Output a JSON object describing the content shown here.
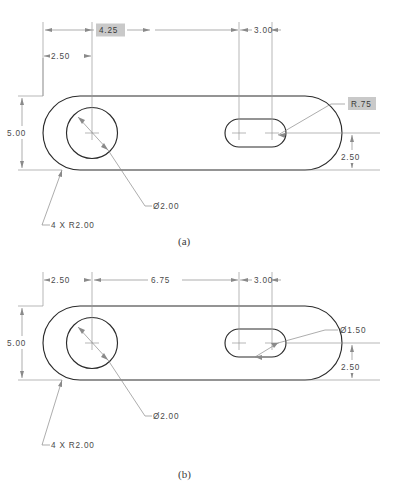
{
  "page": {
    "background_color": "#ffffff",
    "line_color": "#2b2b2b",
    "dimension_color": "#8a8a8a",
    "highlight_color": "#c9c9c9"
  },
  "figures": [
    {
      "id": "a",
      "caption": "(a)",
      "dimensions": {
        "overall_width_to_slot_start": "4.25",
        "overall_width_highlighted": true,
        "hole_offset_from_left": "2.50",
        "slot_length": "3.00",
        "part_height": "5.00",
        "slot_center_from_bottom": "2.50",
        "hole_diameter": "Ø2.00",
        "corner_radii": "4 X R2.00",
        "slot_end_radius": "R.75",
        "slot_end_radius_highlighted": true
      },
      "labels": [
        {
          "name": "dim-4-25",
          "text": "4.25",
          "highlighted": true
        },
        {
          "name": "dim-2-50-top",
          "text": "2.50",
          "highlighted": false
        },
        {
          "name": "dim-3-00",
          "text": "3.00",
          "highlighted": false
        },
        {
          "name": "dim-5-00",
          "text": "5.00",
          "highlighted": false
        },
        {
          "name": "dim-2-50-right",
          "text": "2.50",
          "highlighted": false
        },
        {
          "name": "dim-hole-dia",
          "text": "Ø2.00",
          "highlighted": false
        },
        {
          "name": "dim-corner-radius",
          "text": "4 X R2.00",
          "highlighted": false
        },
        {
          "name": "dim-slot-radius",
          "text": "R.75",
          "highlighted": true
        }
      ]
    },
    {
      "id": "b",
      "caption": "(b)",
      "dimensions": {
        "hole_offset_from_left": "2.50",
        "hole_to_slot_center": "6.75",
        "slot_length": "3.00",
        "part_height": "5.00",
        "slot_center_from_bottom": "2.50",
        "hole_diameter": "Ø2.00",
        "corner_radii": "4 X R2.00",
        "slot_width": "Ø1.50"
      },
      "labels": [
        {
          "name": "dim-2-50-top",
          "text": "2.50",
          "highlighted": false
        },
        {
          "name": "dim-6-75",
          "text": "6.75",
          "highlighted": false
        },
        {
          "name": "dim-3-00",
          "text": "3.00",
          "highlighted": false
        },
        {
          "name": "dim-5-00",
          "text": "5.00",
          "highlighted": false
        },
        {
          "name": "dim-2-50-right",
          "text": "2.50",
          "highlighted": false
        },
        {
          "name": "dim-hole-dia",
          "text": "Ø2.00",
          "highlighted": false
        },
        {
          "name": "dim-corner-radius",
          "text": "4 X R2.00",
          "highlighted": false
        },
        {
          "name": "dim-slot-dia",
          "text": "Ø1.50",
          "highlighted": false
        }
      ]
    }
  ]
}
